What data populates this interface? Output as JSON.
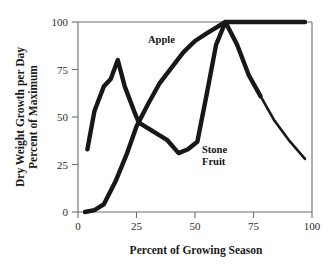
{
  "chart_data": {
    "type": "line",
    "title": "",
    "xlabel": "Percent of Growing Season",
    "ylabel_line1": "Dry Weight Growth per Day",
    "ylabel_line2": "Percent of Maximum",
    "xlim": [
      0,
      100
    ],
    "ylim": [
      0,
      100
    ],
    "xticks": [
      0,
      25,
      50,
      75,
      100
    ],
    "yticks": [
      0,
      25,
      50,
      75,
      100
    ],
    "xtick_labels": [
      "0",
      "25",
      "50",
      "75",
      "100"
    ],
    "ytick_labels": [
      "0",
      "25",
      "50",
      "75",
      "100"
    ],
    "grid": false,
    "legend_position": "inline-annotations",
    "series": [
      {
        "name": "Apple",
        "label_text": "Apple",
        "color": "#171717",
        "x": [
          3,
          7,
          11,
          16,
          21,
          25,
          30,
          35,
          40,
          45,
          50,
          55,
          59,
          63,
          70,
          80,
          90,
          97
        ],
        "y": [
          0,
          1,
          4,
          16,
          31,
          45,
          57,
          68,
          76,
          84,
          90,
          94,
          97,
          100,
          100,
          100,
          100,
          100
        ]
      },
      {
        "name": "Stone Fruit",
        "label_text_line1": "Stone",
        "label_text_line2": "Fruit",
        "color": "#171717",
        "x": [
          4,
          7,
          11,
          14,
          17,
          20,
          24,
          26,
          30,
          34,
          38,
          43,
          47,
          51,
          55,
          59,
          63,
          68,
          73,
          78,
          84,
          90,
          97
        ],
        "y": [
          33,
          53,
          66,
          70,
          80,
          66,
          53,
          47,
          44,
          41,
          38,
          31,
          33,
          37,
          62,
          88,
          100,
          88,
          72,
          61,
          48,
          38,
          28
        ]
      }
    ],
    "annotations": [
      {
        "text": "Apple",
        "x": 37,
        "y": 93
      },
      {
        "text": "Stone Fruit",
        "x": 56,
        "y": 32
      }
    ]
  }
}
